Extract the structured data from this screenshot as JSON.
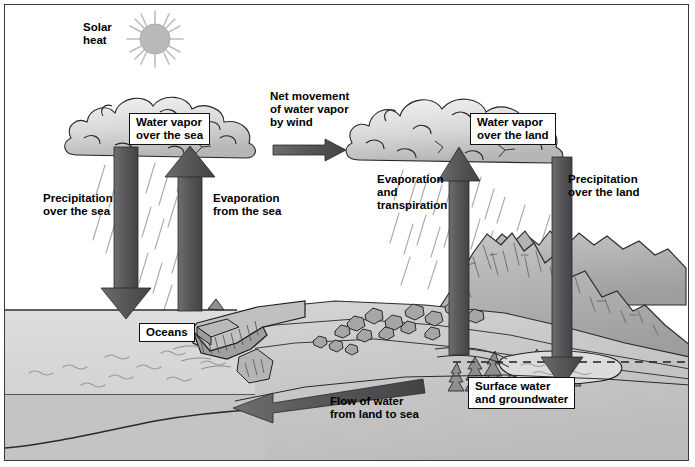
{
  "diagram": {
    "type": "water-cycle-schematic",
    "background_color": "#ffffff",
    "frame_color": "#3a3a3a",
    "arrow_color": "#58585a",
    "ocean_color": "#d7d7d7",
    "land_color": "#c9c9c9",
    "cloud_color": "#d4d4d4"
  },
  "labels": {
    "solar_heat": "Solar\nheat",
    "water_vapor_sea": "Water vapor\nover the sea",
    "net_movement": "Net movement\nof water vapor\nby wind",
    "water_vapor_land": "Water vapor\nover the land",
    "precipitation_sea": "Precipitation\nover the sea",
    "evaporation_sea": "Evaporation\nfrom the sea",
    "evaporation_transpiration": "Evaporation\nand\ntranspiration",
    "precipitation_land": "Precipitation\nover the land",
    "oceans": "Oceans",
    "surface_groundwater": "Surface water\nand groundwater",
    "flow_of_water": "Flow of water\nfrom land to sea"
  },
  "icons": {
    "sun": "sun-icon",
    "cloud_sea": "cloud-icon",
    "cloud_land": "cloud-icon",
    "arrow_down_precip_sea": "arrow-down-icon",
    "arrow_up_evap_sea": "arrow-up-icon",
    "arrow_right_wind": "arrow-right-icon",
    "arrow_up_evap_land": "arrow-up-icon",
    "arrow_down_precip_land": "arrow-down-icon",
    "arrow_left_flow": "arrow-left-icon",
    "water_table": "dashed-line-icon",
    "mountains": "mountain-icon",
    "conifers": "tree-icon",
    "rocks": "rock-icon",
    "rain": "rain-streaks-icon",
    "waves": "wave-lines-icon"
  }
}
